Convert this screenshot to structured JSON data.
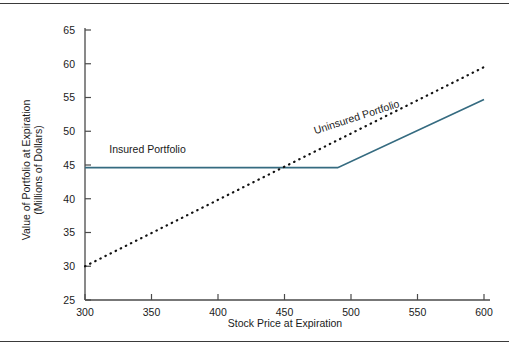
{
  "figure": {
    "background_color": "#ffffff",
    "rule_color": "#3a3a3a"
  },
  "chart_data": {
    "type": "line",
    "title": "",
    "subtitle": "",
    "xlabel": "Stock Price at Expiration",
    "ylabel": "Value of Portfolio at Expiration\n(Millions of Dollars)",
    "ylabel_line1": "Value of Portfolio at Expiration",
    "ylabel_line2": "(Millions of Dollars)",
    "xlim": [
      300,
      600
    ],
    "ylim": [
      25,
      65
    ],
    "xticks": [
      300,
      350,
      400,
      450,
      500,
      550,
      600
    ],
    "yticks": [
      25,
      30,
      35,
      40,
      45,
      50,
      55,
      60,
      65
    ],
    "xtick_labels": [
      "300",
      "350",
      "400",
      "450",
      "500",
      "550",
      "600"
    ],
    "ytick_labels": [
      "25",
      "30",
      "35",
      "40",
      "45",
      "50",
      "55",
      "60",
      "65"
    ],
    "grid": false,
    "legend_position": "inline-annotations",
    "series": [
      {
        "name": "Insured Portfolio",
        "label": "Insured Portfolio",
        "style": "solid",
        "color": "#356B80",
        "x": [
          300,
          490,
          600
        ],
        "values": [
          44.6,
          44.6,
          54.7
        ],
        "annotation": {
          "text": "Insured Portfolio",
          "x": 347,
          "y": 46.8,
          "rotation": 0
        }
      },
      {
        "name": "Uninsured Portfolio",
        "label": "Uninsured Portfolio",
        "style": "dotted",
        "color": "#111111",
        "x": [
          300,
          600
        ],
        "values": [
          30.0,
          59.5
        ],
        "annotation": {
          "text": "Uninsured Portfolio",
          "x": 505,
          "y": 51.6,
          "rotation": -18
        }
      }
    ]
  }
}
